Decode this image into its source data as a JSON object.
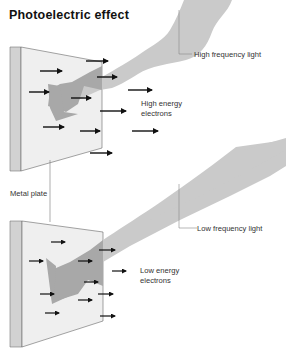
{
  "title": "Photoelectric effect",
  "labels": {
    "high_light": "High frequency light",
    "high_electrons_line1": "High energy",
    "high_electrons_line2": "electrons",
    "metal_plate": "Metal plate",
    "low_light": "Low frequency light",
    "low_electrons_line1": "Low energy",
    "low_electrons_line2": "electrons"
  },
  "colors": {
    "plate_face": "#efefef",
    "plate_edge": "#cfcfcf",
    "light_beam": "#c8c8c8",
    "beam_on_plate": "#a9a9a9",
    "arrow": "#111111",
    "leader_line": "#888888"
  },
  "panels": [
    {
      "name": "high-frequency",
      "light": "High frequency light",
      "electrons": "High energy electrons",
      "electron_arrow_length": "long"
    },
    {
      "name": "low-frequency",
      "light": "Low frequency light",
      "electrons": "Low energy electrons",
      "electron_arrow_length": "short"
    }
  ]
}
